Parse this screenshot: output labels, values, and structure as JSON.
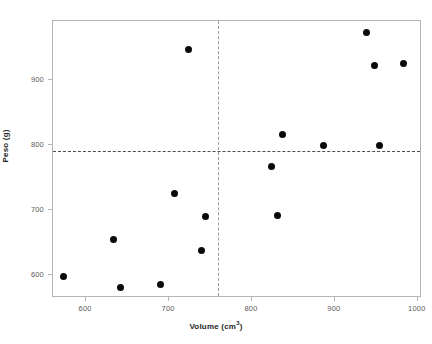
{
  "chart_data": {
    "type": "scatter",
    "title": "",
    "xlabel": "Volume (cm³)",
    "ylabel": "Peso (g)",
    "xlim": [
      560,
      1005
    ],
    "ylim": [
      565,
      990
    ],
    "grid": false,
    "legend": null,
    "xticks": [
      600,
      700,
      800,
      900,
      1000
    ],
    "yticks": [
      600,
      700,
      800,
      900
    ],
    "xtick_labels": [
      "600",
      "700",
      "800",
      "900",
      "1000"
    ],
    "ytick_labels": [
      "600",
      "700",
      "800",
      "900"
    ],
    "marker": {
      "shape": "circle",
      "color": "#0a0a0a",
      "size": 7
    },
    "points": [
      {
        "x": 573,
        "y": 598
      },
      {
        "x": 633,
        "y": 654
      },
      {
        "x": 641,
        "y": 581
      },
      {
        "x": 690,
        "y": 585
      },
      {
        "x": 706,
        "y": 726
      },
      {
        "x": 723,
        "y": 946
      },
      {
        "x": 739,
        "y": 638
      },
      {
        "x": 744,
        "y": 690
      },
      {
        "x": 823,
        "y": 767
      },
      {
        "x": 831,
        "y": 692
      },
      {
        "x": 837,
        "y": 816
      },
      {
        "x": 886,
        "y": 799
      },
      {
        "x": 938,
        "y": 973
      },
      {
        "x": 948,
        "y": 922
      },
      {
        "x": 954,
        "y": 799
      },
      {
        "x": 983,
        "y": 925
      }
    ],
    "annotations": [
      {
        "type": "hline",
        "value": 791,
        "style": "dashed",
        "color": "#4d4d4d"
      },
      {
        "type": "vline",
        "value": 759,
        "style": "dashed",
        "color": "#9a9a9a"
      }
    ]
  },
  "axis": {
    "x_title": "Volume (cm",
    "x_title_sup": "3",
    "x_title_tail": ")",
    "y_title": "Peso (g)"
  }
}
